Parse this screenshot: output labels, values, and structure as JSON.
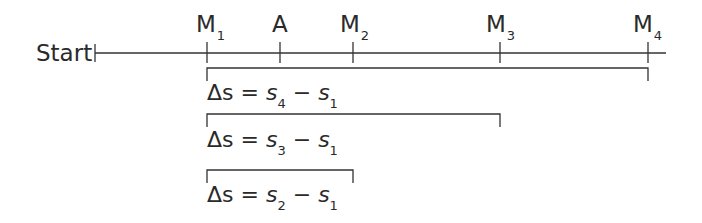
{
  "diagram": {
    "start_label": "Start",
    "markers": [
      {
        "id": "M1",
        "base": "M",
        "sub": "1",
        "x": 207
      },
      {
        "id": "A",
        "base": "A",
        "sub": "",
        "x": 280
      },
      {
        "id": "M2",
        "base": "M",
        "sub": "2",
        "x": 353
      },
      {
        "id": "M3",
        "base": "M",
        "sub": "3",
        "x": 500
      },
      {
        "id": "M4",
        "base": "M",
        "sub": "4",
        "x": 648
      }
    ],
    "intervals": [
      {
        "delta": "Δs",
        "eq": "=",
        "a": "s",
        "a_sub": "4",
        "minus": "−",
        "b": "s",
        "b_sub": "1"
      },
      {
        "delta": "Δs",
        "eq": "=",
        "a": "s",
        "a_sub": "3",
        "minus": "−",
        "b": "s",
        "b_sub": "1"
      },
      {
        "delta": "Δs",
        "eq": "=",
        "a": "s",
        "a_sub": "2",
        "minus": "−",
        "b": "s",
        "b_sub": "1"
      }
    ],
    "line_color": "#333333"
  }
}
